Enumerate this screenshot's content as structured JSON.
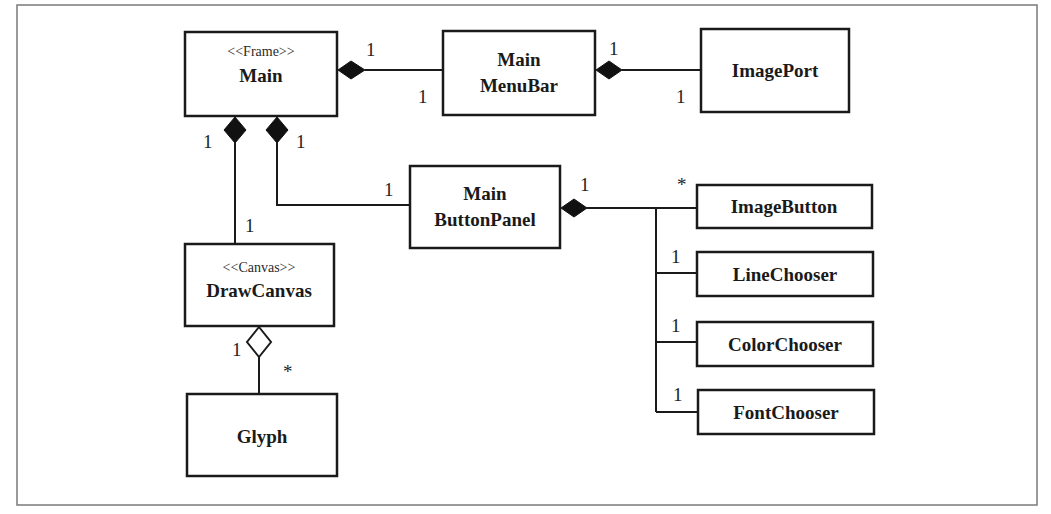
{
  "diagram": {
    "type": "UML class diagram",
    "classes": {
      "main": {
        "stereotype": "<<Frame>>",
        "name": "Main"
      },
      "menubar": {
        "line1": "Main",
        "line2": "MenuBar"
      },
      "imageport": {
        "name": "ImagePort"
      },
      "buttonpanel": {
        "line1": "Main",
        "line2": "ButtonPanel"
      },
      "drawcanvas": {
        "stereotype": "<<Canvas>>",
        "name": "DrawCanvas"
      },
      "glyph": {
        "name": "Glyph"
      },
      "imagebutton": {
        "name": "ImageButton"
      },
      "linechooser": {
        "name": "LineChooser"
      },
      "colorchooser": {
        "name": "ColorChooser"
      },
      "fontchooser": {
        "name": "FontChooser"
      }
    },
    "multiplicities": {
      "main_menubar_whole": "1",
      "main_menubar_part": "1",
      "menubar_imageport_whole": "1",
      "menubar_imageport_part": "1",
      "main_canvas_whole": "1",
      "main_canvas_part": "1",
      "main_buttonpanel_whole": "1",
      "main_buttonpanel_part": "1",
      "canvas_glyph_whole": "1",
      "canvas_glyph_part": "*",
      "buttonpanel_whole": "1",
      "imagebutton_part": "*",
      "linechooser_part": "1",
      "colorchooser_part": "1",
      "fontchooser_part": "1"
    },
    "relationships": [
      {
        "from": "Main",
        "to": "MainMenuBar",
        "kind": "composition"
      },
      {
        "from": "MainMenuBar",
        "to": "ImagePort",
        "kind": "composition"
      },
      {
        "from": "Main",
        "to": "DrawCanvas",
        "kind": "composition"
      },
      {
        "from": "Main",
        "to": "MainButtonPanel",
        "kind": "composition"
      },
      {
        "from": "DrawCanvas",
        "to": "Glyph",
        "kind": "aggregation"
      },
      {
        "from": "MainButtonPanel",
        "to": "ImageButton",
        "kind": "composition"
      },
      {
        "from": "MainButtonPanel",
        "to": "LineChooser",
        "kind": "composition"
      },
      {
        "from": "MainButtonPanel",
        "to": "ColorChooser",
        "kind": "composition"
      },
      {
        "from": "MainButtonPanel",
        "to": "FontChooser",
        "kind": "composition"
      }
    ]
  },
  "colors": {
    "line": "#1a1a1a",
    "frame": "#7a7a7a",
    "background": "#ffffff"
  }
}
